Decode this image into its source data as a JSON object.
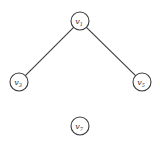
{
  "graph": {
    "nodes": [
      {
        "id": "v1",
        "base": "v",
        "sub": "1",
        "x": 80,
        "y": 21,
        "r": 9
      },
      {
        "id": "v3",
        "base": "v",
        "sub": "3",
        "x": 19,
        "y": 82,
        "r": 9
      },
      {
        "id": "v5",
        "base": "v",
        "sub": "5",
        "x": 142,
        "y": 82,
        "r": 9
      },
      {
        "id": "v7",
        "base": "v",
        "sub": "7",
        "x": 80,
        "y": 126,
        "r": 9
      }
    ],
    "edges": [
      {
        "from": "v1",
        "to": "v3"
      },
      {
        "from": "v1",
        "to": "v5"
      }
    ]
  }
}
